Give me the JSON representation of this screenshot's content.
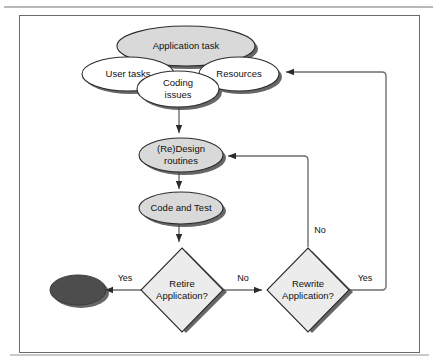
{
  "figure": {
    "kind": "flowchart",
    "background_color": "#ffffff",
    "border_color": "#555555",
    "shadow_color": "#4a4a4a",
    "gray_fill": "#d9d9d9",
    "white_fill": "#ffffff",
    "terminal_fill": "#4d4d4d",
    "line_color": "#6e6e6e",
    "header_artifact": "....."
  },
  "nodes": {
    "application_task": {
      "label": "Application task",
      "shape": "ellipse",
      "fill": "#d9d9d9"
    },
    "user_tasks": {
      "label": "User tasks",
      "shape": "ellipse",
      "fill": "#ffffff"
    },
    "resources": {
      "label": "Resources",
      "shape": "ellipse",
      "fill": "#ffffff"
    },
    "coding_issues": {
      "label_line1": "Coding",
      "label_line2": "issues",
      "shape": "ellipse",
      "fill": "#ffffff"
    },
    "redesign_routines": {
      "label_line1": "(Re)Design",
      "label_line2": "routines",
      "shape": "ellipse",
      "fill": "#d9d9d9"
    },
    "code_and_test": {
      "label": "Code and Test",
      "shape": "ellipse",
      "fill": "#d9d9d9"
    },
    "retire_application": {
      "label_line1": "Retire",
      "label_line2": "Application?",
      "shape": "diamond",
      "fill": "#ececec"
    },
    "rewrite_application": {
      "label_line1": "Rewrite",
      "label_line2": "Application?",
      "shape": "diamond",
      "fill": "#ececec"
    },
    "terminal_end": {
      "label": "",
      "shape": "ellipse",
      "fill": "#4d4d4d"
    }
  },
  "edges": {
    "coding_to_redesign": {
      "label": ""
    },
    "redesign_to_code": {
      "label": ""
    },
    "code_to_retire": {
      "label": ""
    },
    "retire_yes": {
      "label": "Yes"
    },
    "retire_no": {
      "label": "No"
    },
    "rewrite_no": {
      "label": "No"
    },
    "rewrite_yes": {
      "label": "Yes"
    }
  }
}
